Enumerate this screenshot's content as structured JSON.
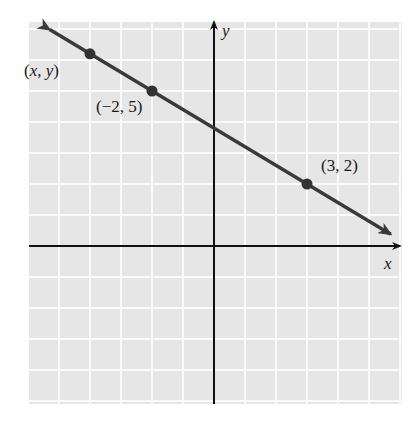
{
  "figure": {
    "type": "coordinate-plane-line",
    "background_color": "#ffffff",
    "grid_fill": "#e6e6e6",
    "grid_line_color": "#fafafa",
    "axis_color": "#111111",
    "line_color": "#3a3a3a",
    "point_color": "#333333"
  },
  "axes": {
    "x_label": "x",
    "y_label": "y",
    "x_range": [
      -6,
      6
    ],
    "y_range": [
      -5.1,
      7.2
    ],
    "unit_px": 31,
    "origin_px": [
      214,
      246
    ]
  },
  "line": {
    "equation": "y = -0.6x + 3.8",
    "slope": -0.6,
    "intercept": 3.8,
    "arrows": "both"
  },
  "points": [
    {
      "label": "(x, y)",
      "x": -4,
      "y": 6.2,
      "label_dx": -66,
      "label_dy": 22
    },
    {
      "label": "(−2, 5)",
      "x": -2,
      "y": 5,
      "label_dx": -56,
      "label_dy": 21
    },
    {
      "label": "(3, 2)",
      "x": 3,
      "y": 2,
      "label_dx": 14,
      "label_dy": -13
    }
  ],
  "chart_data": {
    "type": "line",
    "title": "",
    "xlabel": "x",
    "ylabel": "y",
    "xlim": [
      -6,
      6
    ],
    "ylim": [
      -5,
      7
    ],
    "grid": true,
    "series": [
      {
        "name": "line through (-2, 5) and (3, 2)",
        "x": [
          -6,
          6
        ],
        "y": [
          7.4,
          0.2
        ]
      }
    ],
    "annotations": [
      {
        "text": "(x, y)",
        "x": -4,
        "y": 6.2
      },
      {
        "text": "(−2, 5)",
        "x": -2,
        "y": 5
      },
      {
        "text": "(3, 2)",
        "x": 3,
        "y": 2
      }
    ]
  }
}
